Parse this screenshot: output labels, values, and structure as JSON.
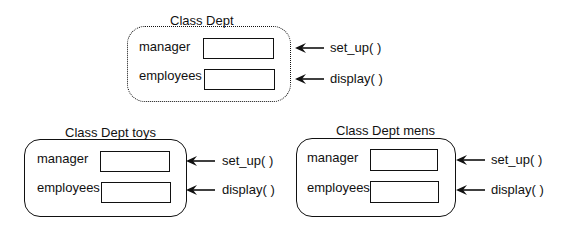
{
  "classes": [
    {
      "id": "dept",
      "title": "Class Dept",
      "border_style": "dotted",
      "fields": [
        {
          "label": "manager"
        },
        {
          "label": "employees"
        }
      ],
      "methods": [
        {
          "label": "set_up( )"
        },
        {
          "label": "display( )"
        }
      ]
    },
    {
      "id": "toys",
      "title": "Class Dept toys",
      "border_style": "solid",
      "fields": [
        {
          "label": "manager"
        },
        {
          "label": "employees"
        }
      ],
      "methods": [
        {
          "label": "set_up( )"
        },
        {
          "label": "display( )"
        }
      ]
    },
    {
      "id": "mens",
      "title": "Class Dept mens",
      "border_style": "solid",
      "fields": [
        {
          "label": "manager"
        },
        {
          "label": "employees"
        }
      ],
      "methods": [
        {
          "label": "set_up( )"
        },
        {
          "label": "display( )"
        }
      ]
    }
  ]
}
